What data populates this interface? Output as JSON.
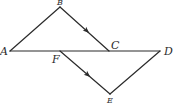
{
  "diagram": {
    "type": "geometry",
    "line_color": "#2b2b2b",
    "points": {
      "A": {
        "label": "A",
        "x": 10,
        "y": 51
      },
      "B": {
        "label": "B",
        "x": 60,
        "y": 7
      },
      "C": {
        "label": "C",
        "x": 109,
        "y": 51
      },
      "D": {
        "label": "D",
        "x": 160,
        "y": 51
      },
      "E": {
        "label": "E",
        "x": 110,
        "y": 94
      },
      "F": {
        "label": "F",
        "x": 60,
        "y": 51
      }
    },
    "segments": [
      {
        "from": "A",
        "to": "B"
      },
      {
        "from": "B",
        "to": "C",
        "arrow": true
      },
      {
        "from": "A",
        "to": "D"
      },
      {
        "from": "F",
        "to": "E",
        "arrow": true
      },
      {
        "from": "E",
        "to": "D"
      }
    ],
    "parallel_marks": [
      "BC",
      "FE"
    ]
  }
}
